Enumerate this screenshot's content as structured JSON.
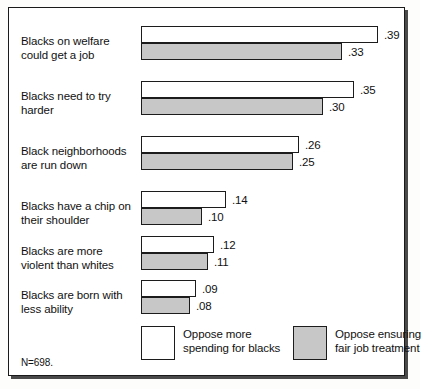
{
  "chart_data": {
    "type": "bar",
    "title": "",
    "subtitle": "",
    "xlabel": "",
    "ylabel": "",
    "orientation": "horizontal",
    "grid": false,
    "xlim": [
      0,
      0.4
    ],
    "legend_position": "bottom",
    "categories": [
      "Blacks on welfare could get a job",
      "Blacks need to try harder",
      "Black neighborhoods are run down",
      "Blacks have a chip on their shoulder",
      "Blacks are more violent than whites",
      "Blacks are born with less ability"
    ],
    "category_lines": [
      [
        "Blacks on welfare",
        "could get a job"
      ],
      [
        "Blacks need to try",
        "harder"
      ],
      [
        "Black neighborhoods",
        "are run down"
      ],
      [
        "Blacks have a chip on",
        "their shoulder"
      ],
      [
        "Blacks are more",
        "violent than whites"
      ],
      [
        "Blacks are born with",
        "less ability"
      ]
    ],
    "series": [
      {
        "name": "Oppose more spending for blacks",
        "color": "#ffffff",
        "values": [
          0.39,
          0.35,
          0.26,
          0.14,
          0.12,
          0.09
        ],
        "labels": [
          ".39",
          ".35",
          ".26",
          ".14",
          ".12",
          ".09"
        ]
      },
      {
        "name": "Oppose ensuring fair job treatment",
        "color": "#c7c7c7",
        "values": [
          0.33,
          0.3,
          0.25,
          0.1,
          0.11,
          0.08
        ],
        "labels": [
          ".33",
          ".30",
          ".25",
          ".10",
          ".11",
          ".08"
        ]
      }
    ],
    "annotations": [
      "N=698."
    ]
  },
  "legend": {
    "items": [
      {
        "swatch": "white",
        "line1": "Oppose more",
        "line2": "spending for blacks"
      },
      {
        "swatch": "gray",
        "line1": "Oppose ensuring",
        "line2": "fair job treatment"
      }
    ]
  },
  "footnote": "N=698.",
  "colors": {
    "bar_white": "#ffffff",
    "bar_gray": "#c7c7c7",
    "outline": "#1c1c1c",
    "text": "#111111",
    "background": "#ffffff"
  }
}
